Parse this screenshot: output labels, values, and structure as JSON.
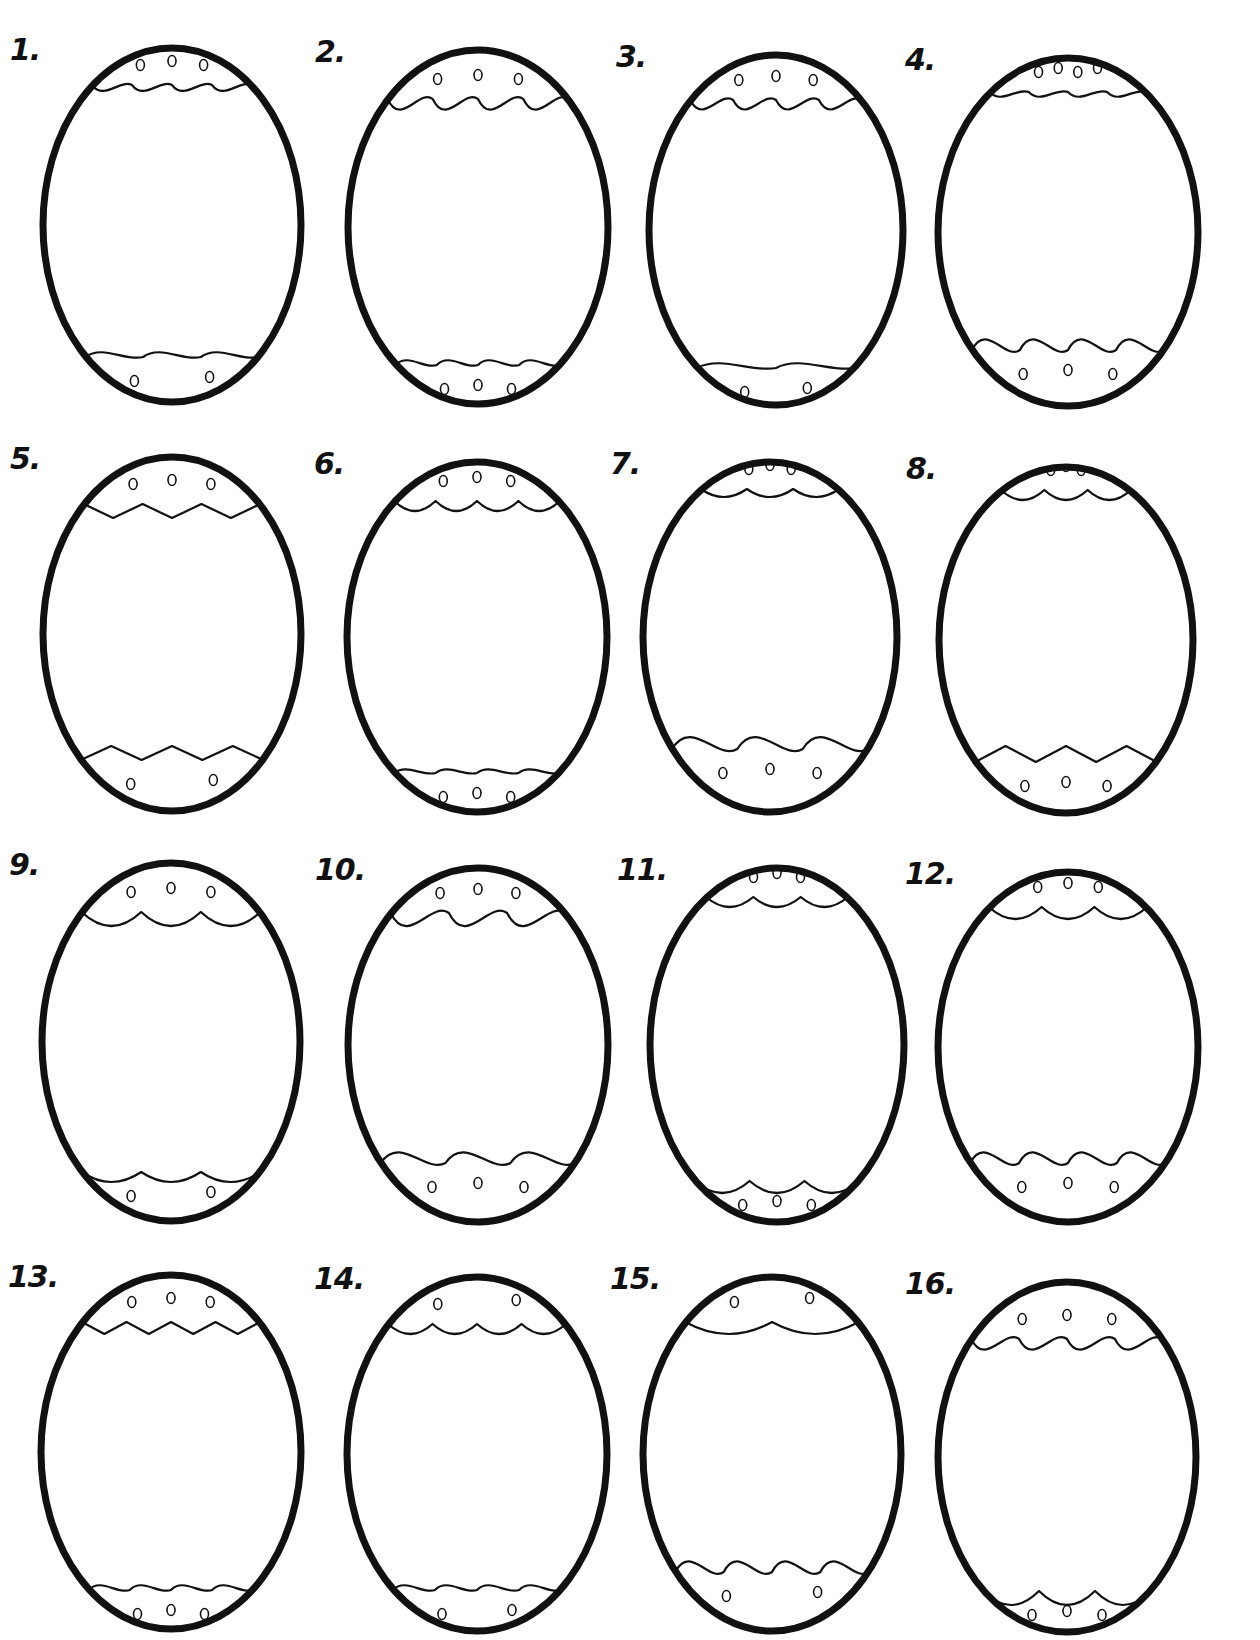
{
  "sheet": {
    "background": "#ffffff",
    "ink": "#111111",
    "egg_count": 16,
    "columns": 4,
    "rows": 4
  },
  "eggs": [
    {
      "label": "1.",
      "cx": 172,
      "cy": 225,
      "rx": 132,
      "ry": 180,
      "top": {
        "style": "wave",
        "y": -140,
        "n": 4,
        "amp": 10,
        "dots": 3
      },
      "bottom": {
        "style": "wave",
        "y": 132,
        "n": 3,
        "amp": 8,
        "dots": 2
      }
    },
    {
      "label": "2.",
      "cx": 478,
      "cy": 227,
      "rx": 133,
      "ry": 180,
      "top": {
        "style": "wave",
        "y": -128,
        "n": 4,
        "amp": 18,
        "dots": 3
      },
      "bottom": {
        "style": "wave",
        "y": 138,
        "n": 4,
        "amp": 8,
        "dots": 3
      }
    },
    {
      "label": "3.",
      "cx": 776,
      "cy": 230,
      "rx": 130,
      "ry": 178,
      "top": {
        "style": "wave",
        "y": -130,
        "n": 4,
        "amp": 16,
        "dots": 3
      },
      "bottom": {
        "style": "wave",
        "y": 138,
        "n": 2,
        "amp": 8,
        "dots": 2
      }
    },
    {
      "label": "4.",
      "cx": 1068,
      "cy": 232,
      "rx": 133,
      "ry": 177,
      "top": {
        "style": "wave",
        "y": -140,
        "n": 4,
        "amp": 8,
        "dots": 4
      },
      "bottom": {
        "style": "wave",
        "y": 118,
        "n": 4,
        "amp": 18,
        "dots": 3
      }
    },
    {
      "label": "5.",
      "cx": 172,
      "cy": 634,
      "rx": 132,
      "ry": 180,
      "top": {
        "style": "zigzag",
        "y": -130,
        "n": 3,
        "amp": 14,
        "dots": 3
      },
      "bottom": {
        "style": "zigzag",
        "y": 126,
        "n": 3,
        "amp": 14,
        "dots": 2
      }
    },
    {
      "label": "6.",
      "cx": 477,
      "cy": 637,
      "rx": 133,
      "ry": 178,
      "top": {
        "style": "scallop",
        "y": -136,
        "n": 4,
        "amp": 10,
        "dots": 3
      },
      "bottom": {
        "style": "wave",
        "y": 136,
        "n": 4,
        "amp": 6,
        "dots": 3
      }
    },
    {
      "label": "7.",
      "cx": 770,
      "cy": 637,
      "rx": 130,
      "ry": 178,
      "top": {
        "style": "scallop",
        "y": -148,
        "n": 3,
        "amp": 8,
        "dots": 3
      },
      "bottom": {
        "style": "wave",
        "y": 112,
        "n": 3,
        "amp": 20,
        "dots": 3
      }
    },
    {
      "label": "8.",
      "cx": 1066,
      "cy": 640,
      "rx": 130,
      "ry": 176,
      "top": {
        "style": "scallop",
        "y": -150,
        "n": 3,
        "amp": 10,
        "dots": 3
      },
      "bottom": {
        "style": "zigzag",
        "y": 122,
        "n": 3,
        "amp": 16,
        "dots": 3
      }
    },
    {
      "label": "9.",
      "cx": 171,
      "cy": 1042,
      "rx": 132,
      "ry": 182,
      "top": {
        "style": "scallop",
        "y": -130,
        "n": 3,
        "amp": 14,
        "dots": 3
      },
      "bottom": {
        "style": "scallop-up",
        "y": 130,
        "n": 3,
        "amp": 10,
        "dots": 2
      }
    },
    {
      "label": "10.",
      "cx": 478,
      "cy": 1045,
      "rx": 133,
      "ry": 180,
      "top": {
        "style": "wave",
        "y": -132,
        "n": 3,
        "amp": 22,
        "dots": 3
      },
      "bottom": {
        "style": "wave",
        "y": 118,
        "n": 3,
        "amp": 18,
        "dots": 3
      }
    },
    {
      "label": "11.",
      "cx": 777,
      "cy": 1045,
      "rx": 130,
      "ry": 180,
      "top": {
        "style": "scallop",
        "y": -148,
        "n": 3,
        "amp": 10,
        "dots": 3
      },
      "bottom": {
        "style": "scallop-up",
        "y": 136,
        "n": 3,
        "amp": 12,
        "dots": 3
      }
    },
    {
      "label": "12.",
      "cx": 1068,
      "cy": 1047,
      "rx": 133,
      "ry": 178,
      "top": {
        "style": "scallop",
        "y": -140,
        "n": 3,
        "amp": 12,
        "dots": 3
      },
      "bottom": {
        "style": "wave",
        "y": 116,
        "n": 4,
        "amp": 18,
        "dots": 3
      }
    },
    {
      "label": "13.",
      "cx": 171,
      "cy": 1452,
      "rx": 133,
      "ry": 180,
      "top": {
        "style": "zigzag",
        "y": -130,
        "n": 4,
        "amp": 12,
        "dots": 3
      },
      "bottom": {
        "style": "wave",
        "y": 138,
        "n": 4,
        "amp": 8,
        "dots": 3
      }
    },
    {
      "label": "14.",
      "cx": 477,
      "cy": 1454,
      "rx": 133,
      "ry": 180,
      "top": {
        "style": "scallop",
        "y": -130,
        "n": 4,
        "amp": 10,
        "dots": 2
      },
      "bottom": {
        "style": "wave",
        "y": 136,
        "n": 4,
        "amp": 8,
        "dots": 2
      }
    },
    {
      "label": "15.",
      "cx": 772,
      "cy": 1454,
      "rx": 132,
      "ry": 180,
      "top": {
        "style": "scallop-wide",
        "y": -132,
        "n": 2,
        "amp": 12,
        "dots": 2
      },
      "bottom": {
        "style": "wave",
        "y": 118,
        "n": 4,
        "amp": 18,
        "dots": 2
      }
    },
    {
      "label": "16.",
      "cx": 1067,
      "cy": 1457,
      "rx": 132,
      "ry": 178,
      "top": {
        "style": "wave",
        "y": -118,
        "n": 4,
        "amp": 18,
        "dots": 3
      },
      "bottom": {
        "style": "scallop-up",
        "y": 134,
        "n": 3,
        "amp": 14,
        "dots": 3
      }
    }
  ]
}
